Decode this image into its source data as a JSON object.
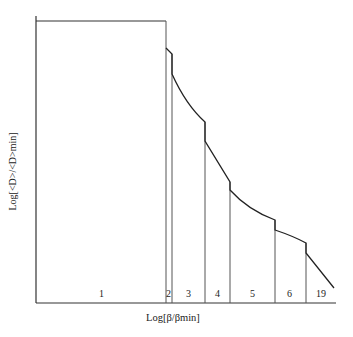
{
  "figure": {
    "ylabel": "Log[<D>/<D>min]",
    "xlabel": "Log[β/βmin]",
    "regions": [
      {
        "label": "1",
        "x": 102
      },
      {
        "label": "2",
        "x": 166
      },
      {
        "label": "3",
        "x": 186
      },
      {
        "label": "4",
        "x": 215
      },
      {
        "label": "5",
        "x": 250
      },
      {
        "label": "6",
        "x": 287
      },
      {
        "label": "19",
        "x": 318
      }
    ],
    "colors": {
      "line": "#222222",
      "background": "#ffffff"
    }
  }
}
